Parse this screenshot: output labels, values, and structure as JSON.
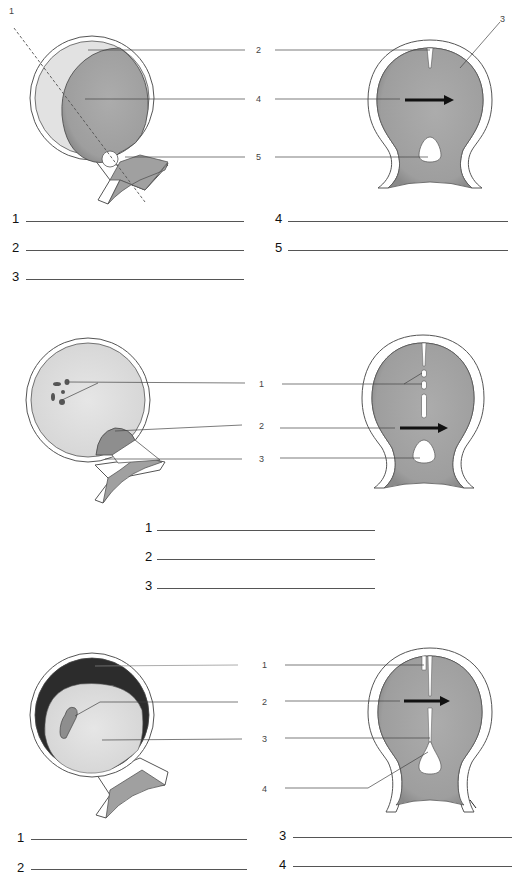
{
  "colors": {
    "dark_cavity": "#9a9a9a",
    "mid_cavity": "#a8a8a8",
    "light_fill": "#dedede",
    "very_dark": "#2a2a2a",
    "wall": "#ffffff",
    "outline": "#555555"
  },
  "panels": [
    {
      "name": "panel-1",
      "left_diagram": {
        "labels": [
          "1",
          "2",
          "4",
          "5"
        ]
      },
      "right_diagram": {
        "labels": [
          "2",
          "3",
          "4",
          "5"
        ]
      },
      "answers": [
        {
          "num": "1"
        },
        {
          "num": "2"
        },
        {
          "num": "3"
        },
        {
          "num": "4"
        },
        {
          "num": "5"
        }
      ]
    },
    {
      "name": "panel-2",
      "left_diagram": {
        "labels": []
      },
      "right_diagram": {
        "labels": [
          "1",
          "2",
          "3"
        ]
      },
      "answers": [
        {
          "num": "1"
        },
        {
          "num": "2"
        },
        {
          "num": "3"
        }
      ]
    },
    {
      "name": "panel-3",
      "left_diagram": {
        "labels": []
      },
      "right_diagram": {
        "labels": [
          "1",
          "2",
          "3",
          "4"
        ]
      },
      "answers": [
        {
          "num": "1"
        },
        {
          "num": "2"
        },
        {
          "num": "3"
        },
        {
          "num": "4"
        }
      ]
    }
  ]
}
